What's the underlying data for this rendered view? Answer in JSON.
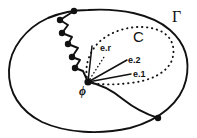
{
  "figure": {
    "caption_free": true,
    "background_color": "#ffffff",
    "stroke_color": "#111111",
    "width": 197,
    "height": 138,
    "labels": {
      "outer_boundary": "Γ",
      "inner_region": "C",
      "radial_vector": "e.r",
      "basis_vector_2": "e.2",
      "basis_vector_1": "e.1",
      "origin": "ϕ"
    },
    "elements": {
      "outer_curve_name": "Gamma boundary curve",
      "inner_curve_name": "C dotted curve",
      "zigzag_name": "piecewise polygonal path",
      "smooth_arc_name": "smooth curve to boundary",
      "node_count": 8
    },
    "geometry": {
      "origin_point": [
        88,
        82
      ],
      "outer_curve_path": "M 88 10 C 120 8 152 14 170 30 C 186 44 190 62 186 80 C 181 102 160 120 130 128 C 100 135 66 133 42 122 C 20 111 8 92 9 70 C 10 48 26 28 48 18 C 60 13 74 10 88 10 Z",
      "inner_dotted_path": "M 88 82 C 83 66 90 48 104 38 C 120 27 142 24 158 30 C 172 35 176 48 172 60 C 167 73 150 81 130 83 C 114 85 99 85 88 82 Z",
      "zigzag_points": [
        [
          74,
          11
        ],
        [
          60,
          20
        ],
        [
          68,
          25
        ],
        [
          62,
          33
        ],
        [
          72,
          37
        ],
        [
          68,
          44
        ],
        [
          78,
          48
        ],
        [
          72,
          57
        ],
        [
          80,
          60
        ],
        [
          75,
          68
        ],
        [
          83,
          71
        ],
        [
          88,
          82
        ]
      ],
      "zigzag_nodes": [
        [
          74,
          11
        ],
        [
          60,
          20
        ],
        [
          62,
          33
        ],
        [
          68,
          44
        ],
        [
          72,
          57
        ],
        [
          75,
          68
        ]
      ],
      "smooth_arc_path": "M 88 82 C 100 84 112 90 124 100 C 134 108 146 114 158 118",
      "boundary_node": [
        158,
        118
      ],
      "ray_er": [
        [
          88,
          82
        ],
        [
          92,
          46
        ]
      ],
      "ray_e2": [
        [
          88,
          82
        ],
        [
          127,
          60
        ]
      ],
      "ray_e1": [
        [
          88,
          82
        ],
        [
          131,
          74
        ]
      ],
      "ray_dotted": [
        [
          88,
          82
        ],
        [
          104,
          57
        ]
      ],
      "dot_radius": 3.2
    }
  }
}
